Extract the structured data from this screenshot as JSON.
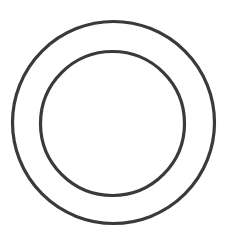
{
  "canvas": {
    "width": 230,
    "height": 239,
    "background": "#ffffff"
  },
  "shapes": {
    "outer_circle": {
      "cx": 113.5,
      "cy": 122.5,
      "r": 101,
      "stroke": "#3a3a3a",
      "stroke_width": 3.2,
      "fill": "none"
    },
    "inner_circle": {
      "cx": 112.5,
      "cy": 123.5,
      "r": 72,
      "stroke": "#3a3a3a",
      "stroke_width": 3.2,
      "fill": "none"
    }
  }
}
